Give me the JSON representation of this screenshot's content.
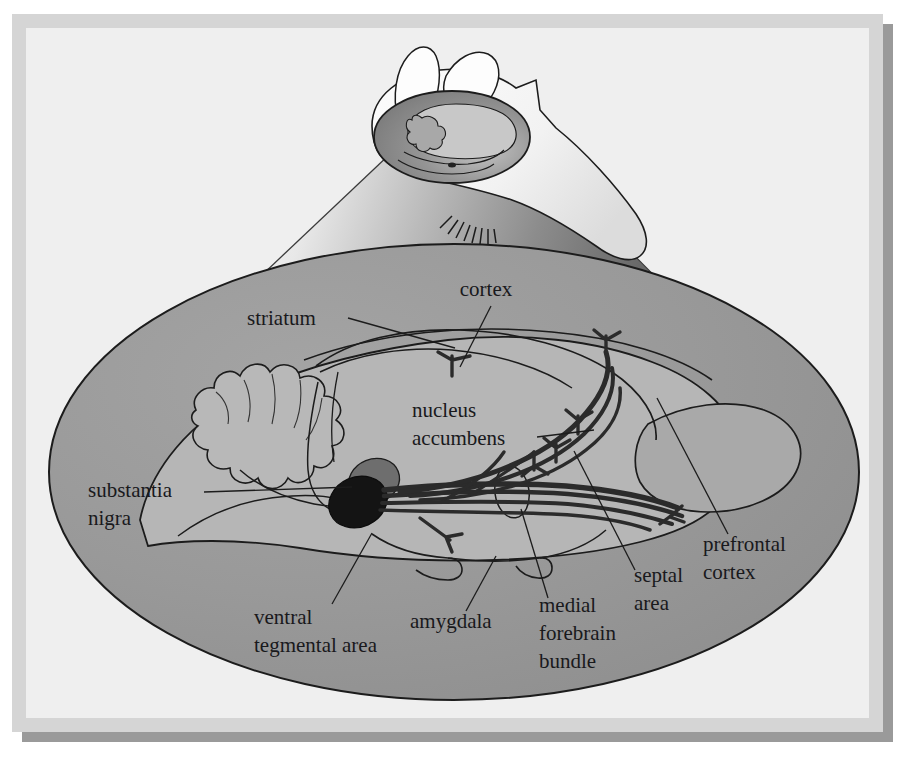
{
  "frame": {
    "outer_margin_color": "#d8d8d8",
    "panel_color": "#efefef",
    "shadow_color": "#9a9a9a",
    "border_color": "#c6c6c6"
  },
  "palette": {
    "brain_ellipse_fill": "#969696",
    "brain_body_fill": "#b4b4b4",
    "brain_light_fill": "#c2c2c2",
    "cone_light": "#fdfdfd",
    "cone_dark": "#4a4a4a",
    "head_fill": "#fbfbfb",
    "head_inset_fill": "#8e8e8e",
    "vta_dark": "#141414",
    "substantia_nigra_fill": "#6e6e6e",
    "fiber_color": "#2b2b2b",
    "outline_color": "#1c1c1c",
    "leader_color": "#1c1c1c",
    "label_color": "#19191c"
  },
  "labels": [
    {
      "id": "cortex",
      "text": "cortex",
      "lines": [
        "cortex"
      ],
      "x": 486,
      "y": 296,
      "anchor": "middle",
      "leader": "M 491,306 L 460,367"
    },
    {
      "id": "striatum",
      "text": "striatum",
      "lines": [
        "striatum"
      ],
      "x": 247,
      "y": 325,
      "anchor": "start",
      "leader": "M 348,318 L 455,348"
    },
    {
      "id": "nucleus-accumbens",
      "text": "nucleus accumbens",
      "lines": [
        "nucleus",
        "accumbens"
      ],
      "x": 412,
      "y": 417,
      "anchor": "start",
      "leader": "M 537,437 L 594,430"
    },
    {
      "id": "substantia-nigra",
      "text": "substantia nigra",
      "lines": [
        "substantia",
        "nigra"
      ],
      "x": 88,
      "y": 497,
      "anchor": "start",
      "leader": "M 204,492 L 352,487"
    },
    {
      "id": "ventral-tegmental-area",
      "text": "ventral tegmental area",
      "lines": [
        "ventral",
        "tegmental area"
      ],
      "x": 254,
      "y": 624,
      "anchor": "start",
      "leader": "M 332,604 L 372,533"
    },
    {
      "id": "amygdala",
      "text": "amygdala",
      "lines": [
        "amygdala"
      ],
      "x": 410,
      "y": 628,
      "anchor": "start",
      "leader": "M 466,611 L 496,556"
    },
    {
      "id": "medial-forebrain-bundle",
      "text": "medial forebrain bundle",
      "lines": [
        "medial",
        "forebrain",
        "bundle"
      ],
      "x": 539,
      "y": 612,
      "anchor": "start",
      "leader": "M 548,598 L 521,509"
    },
    {
      "id": "septal-area",
      "text": "septal area",
      "lines": [
        "septal",
        "area"
      ],
      "x": 634,
      "y": 582,
      "anchor": "start",
      "leader": "M 635,570 L 574,451"
    },
    {
      "id": "prefrontal-cortex",
      "text": "prefrontal cortex",
      "lines": [
        "prefrontal",
        "cortex"
      ],
      "x": 703,
      "y": 551,
      "anchor": "start",
      "leader": "M 728,534 L 657,398"
    }
  ]
}
